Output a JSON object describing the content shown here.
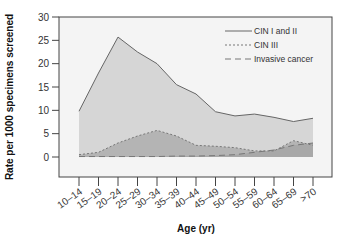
{
  "chart_data": {
    "type": "area",
    "title": "",
    "xlabel": "Age (yr)",
    "ylabel": "Rate per 1000 specimens screened",
    "ylim": [
      0,
      30
    ],
    "yticks": [
      0,
      5,
      10,
      15,
      20,
      25,
      30
    ],
    "grid": false,
    "legend_position": "upper right",
    "categories": [
      "10–14",
      "15–19",
      "20–24",
      "25–29",
      "30–34",
      "35–39",
      "40–44",
      "45–49",
      "50–54",
      "55–59",
      "60–64",
      "65–69",
      ">70"
    ],
    "series": [
      {
        "name": "CIN I and II",
        "line_style": "solid",
        "fill": "#d6d6d6",
        "stroke": "#666666",
        "values": [
          9.8,
          18.0,
          25.7,
          22.5,
          20.0,
          15.5,
          13.5,
          9.7,
          8.8,
          9.2,
          8.5,
          7.6,
          8.3
        ]
      },
      {
        "name": "CIN III",
        "line_style": "dotted",
        "fill": "#b4b4b4",
        "stroke": "#777777",
        "values": [
          0.5,
          1.0,
          3.0,
          4.5,
          5.7,
          4.5,
          2.5,
          2.3,
          2.0,
          1.3,
          1.3,
          3.5,
          2.5
        ]
      },
      {
        "name": "Invasive cancer",
        "line_style": "dashed",
        "fill": "#a8a8a8",
        "stroke": "#777777",
        "values": [
          0.1,
          0.1,
          0.1,
          0.1,
          0.1,
          0.2,
          0.2,
          0.3,
          0.5,
          1.0,
          1.5,
          2.5,
          3.0
        ]
      }
    ]
  },
  "legend": {
    "items": [
      "CIN I and II",
      "CIN III",
      "Invasive cancer"
    ]
  },
  "axes": {
    "x_title": "Age (yr)",
    "y_title": "Rate per 1000 specimens screened"
  }
}
